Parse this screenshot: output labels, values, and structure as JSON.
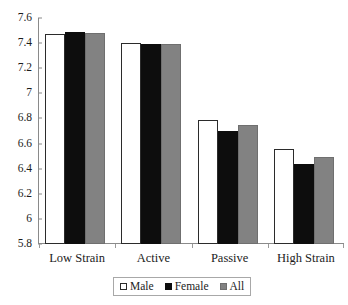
{
  "chart_data": {
    "type": "bar",
    "title": "",
    "subtitle": "",
    "xlabel": "",
    "ylabel": "",
    "categories": [
      "Low Strain",
      "Active",
      "Passive",
      "High Strain"
    ],
    "series": [
      {
        "name": "Male",
        "color": "#ffffff",
        "values": [
          7.47,
          7.4,
          6.79,
          6.56
        ]
      },
      {
        "name": "Female",
        "color": "#0d0d0d",
        "values": [
          7.49,
          7.39,
          6.7,
          6.44
        ]
      },
      {
        "name": "All",
        "color": "#828282",
        "values": [
          7.48,
          7.39,
          6.75,
          6.49
        ]
      }
    ],
    "ylim": [
      5.8,
      7.6
    ],
    "ytick_step": 0.2,
    "ytick_labels": [
      "7.6",
      "7.4",
      "7.2",
      "7",
      "6.8",
      "6.6",
      "6.4",
      "6.2",
      "6",
      "5.8"
    ],
    "ytick_values": [
      7.6,
      7.4,
      7.2,
      7.0,
      6.8,
      6.6,
      6.4,
      6.2,
      6.0,
      5.8
    ],
    "grid": false,
    "legend_position": "bottom",
    "legend_entries": [
      "Male",
      "Female",
      "All"
    ],
    "annotations": []
  },
  "axes": {
    "y_axis_name": "value-axis",
    "x_axis_name": "category-axis"
  }
}
